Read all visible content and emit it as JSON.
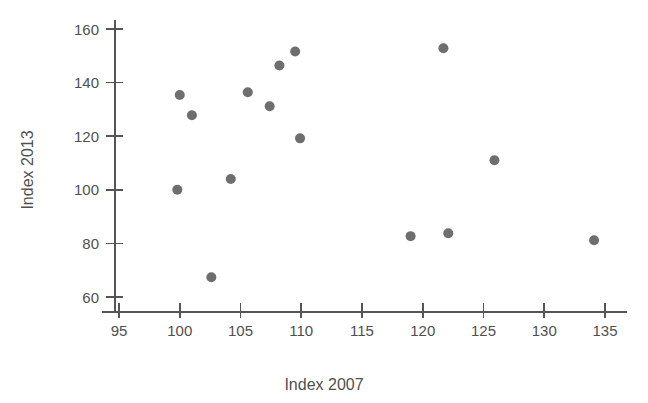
{
  "chart_data": {
    "type": "scatter",
    "title": "",
    "xlabel": "Index 2007",
    "ylabel": "Index 2013",
    "xlim": [
      95,
      135
    ],
    "ylim": [
      55,
      163
    ],
    "grid": false,
    "legend": "none",
    "marker": {
      "shape": "circle",
      "color": "#6e6e6e",
      "radius": 5
    },
    "xticks": [
      95,
      100,
      105,
      110,
      115,
      120,
      125,
      130,
      135
    ],
    "xtick_labels": [
      "95",
      "100",
      "105",
      "110",
      "115",
      "120",
      "125",
      "130",
      "135"
    ],
    "yticks": [
      60,
      80,
      100,
      120,
      140,
      160
    ],
    "ytick_labels": [
      "60",
      "80",
      "100",
      "120",
      "140",
      "160"
    ],
    "x": [
      100.0,
      101.0,
      99.8,
      102.6,
      104.2,
      105.6,
      107.4,
      108.2,
      109.5,
      109.9,
      119.0,
      122.1,
      121.7,
      125.9,
      134.1
    ],
    "y": [
      135.4,
      127.8,
      100.0,
      67.4,
      104.0,
      136.4,
      131.2,
      146.4,
      151.6,
      119.2,
      82.7,
      83.8,
      152.8,
      111.0,
      81.2
    ],
    "points": [
      {
        "x": 100.0,
        "y": 135.4
      },
      {
        "x": 101.0,
        "y": 127.8
      },
      {
        "x": 99.8,
        "y": 100.0
      },
      {
        "x": 102.6,
        "y": 67.4
      },
      {
        "x": 104.2,
        "y": 104.0
      },
      {
        "x": 105.6,
        "y": 136.4
      },
      {
        "x": 107.4,
        "y": 131.2
      },
      {
        "x": 108.2,
        "y": 146.4
      },
      {
        "x": 109.5,
        "y": 151.6
      },
      {
        "x": 109.9,
        "y": 119.2
      },
      {
        "x": 119.0,
        "y": 82.7
      },
      {
        "x": 122.1,
        "y": 83.8
      },
      {
        "x": 121.7,
        "y": 152.8
      },
      {
        "x": 125.9,
        "y": 111.0
      },
      {
        "x": 134.1,
        "y": 81.2
      }
    ]
  },
  "axes": {
    "x_title": "Index 2007",
    "y_title": "Index 2013"
  }
}
